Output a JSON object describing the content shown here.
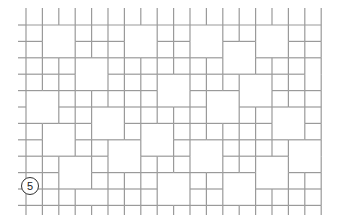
{
  "figure": {
    "type": "tile-layout-pattern",
    "label": "5",
    "line_color": "#9a9a9a",
    "grid": {
      "origin_x": 26,
      "origin_y": 25,
      "pitch": 16.4,
      "cols": 18,
      "rows": 11,
      "stub_top": 17,
      "stub_bottom": 12,
      "stub_left": 8
    },
    "big_squares": [
      {
        "c": 1,
        "r": 0
      },
      {
        "c": 6,
        "r": 0
      },
      {
        "c": 10,
        "r": 0
      },
      {
        "c": 14,
        "r": 0
      },
      {
        "c": 3,
        "r": 2
      },
      {
        "c": 12,
        "r": 1
      },
      {
        "c": 17,
        "r": 2
      },
      {
        "c": 0,
        "r": 4
      },
      {
        "c": 8,
        "r": 3
      },
      {
        "c": 13,
        "r": 3
      },
      {
        "c": 4,
        "r": 5
      },
      {
        "c": 11,
        "r": 4
      },
      {
        "c": 15,
        "r": 5
      },
      {
        "c": 1,
        "r": 6
      },
      {
        "c": 7,
        "r": 6
      },
      {
        "c": 16,
        "r": 7
      },
      {
        "c": 5,
        "r": 7
      },
      {
        "c": 10,
        "r": 7
      },
      {
        "c": 14,
        "r": 8
      },
      {
        "c": 2,
        "r": 8
      },
      {
        "c": 8,
        "r": 9
      },
      {
        "c": 12,
        "r": 9
      },
      {
        "c": 3,
        "r": 10
      }
    ]
  }
}
